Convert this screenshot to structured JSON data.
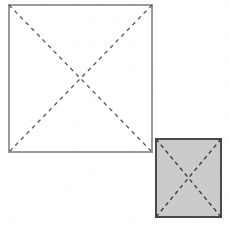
{
  "figure": {
    "background_color": "#ffffff",
    "canvas": {
      "width": 229,
      "height": 225
    },
    "shapes": [
      {
        "id": "large-square",
        "label": "Large square outline",
        "fill_color": "#ffffff",
        "stroke_color": "#9a9a9a",
        "stroke_width": 1.4,
        "x": 9,
        "y": 5,
        "width": 143,
        "height": 147,
        "diagonals": {
          "style": "dashed",
          "stroke_color": "#555555",
          "stroke_width": 1.3,
          "dash_pattern": "4 4",
          "center_x": 80.5,
          "center_y": 78.5,
          "lines": [
            {
              "id": "diagonal-tl-br",
              "x1": 9,
              "y1": 5,
              "x2": 152,
              "y2": 152
            },
            {
              "id": "diagonal-tr-bl",
              "x1": 152,
              "y1": 5,
              "x2": 9,
              "y2": 152
            }
          ]
        }
      },
      {
        "id": "small-square",
        "label": "Small shaded square",
        "fill_color": "#cbcbcb",
        "stroke_color": "#4a4a4a",
        "stroke_width": 1.6,
        "x": 156,
        "y": 139,
        "width": 65,
        "height": 78,
        "diagonals": {
          "style": "dashed",
          "stroke_color": "#3a3a3a",
          "stroke_width": 1.4,
          "dash_pattern": "4 3.5",
          "center_x": 188.5,
          "center_y": 178,
          "lines": [
            {
              "id": "diagonal-tl-br",
              "x1": 156,
              "y1": 139,
              "x2": 221,
              "y2": 217
            },
            {
              "id": "diagonal-tr-bl",
              "x1": 221,
              "y1": 139,
              "x2": 156,
              "y2": 217
            }
          ]
        }
      }
    ]
  }
}
